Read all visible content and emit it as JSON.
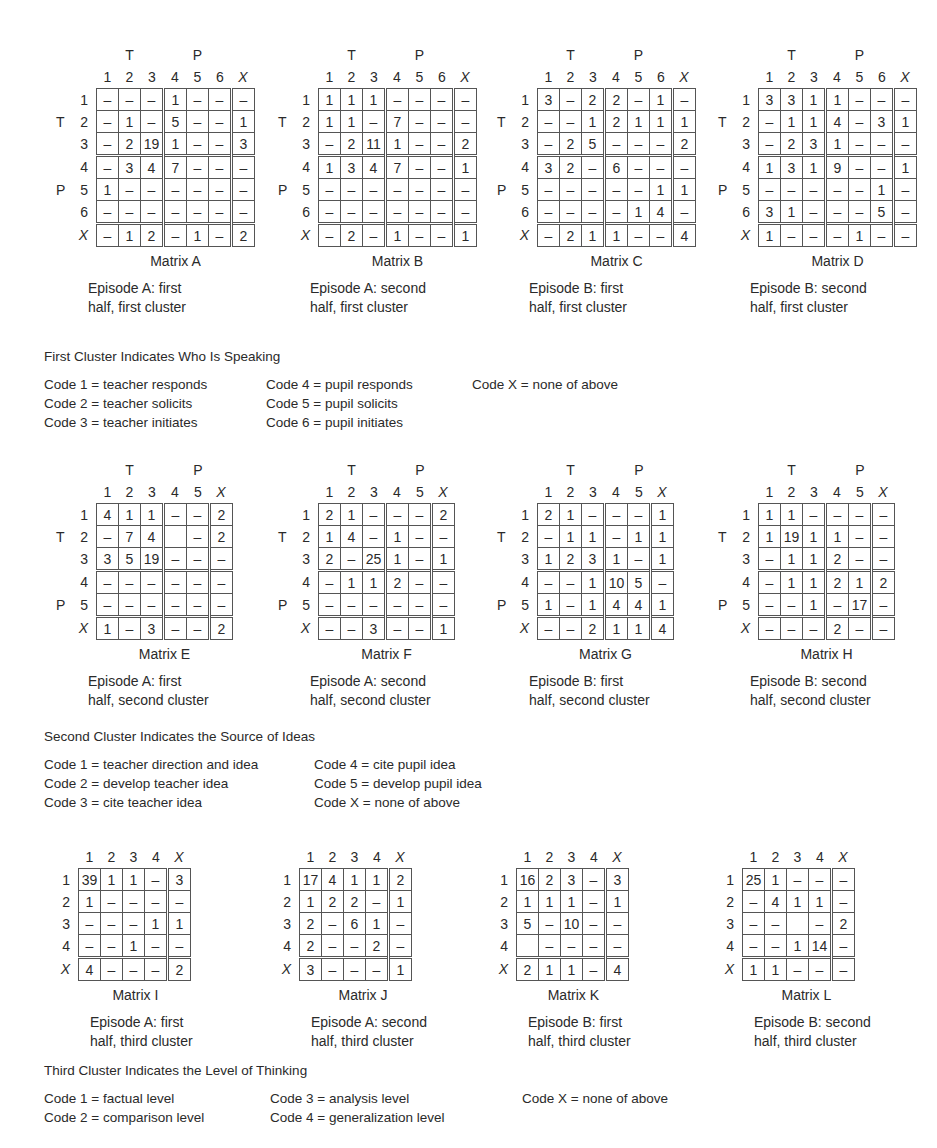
{
  "sets": [
    {
      "id": "first",
      "group_labels": {
        "teacher": "T",
        "pupil": "P"
      },
      "legend": {
        "heading": "First Cluster Indicates Who Is Speaking",
        "columns": [
          [
            "Code 1 = teacher responds",
            "Code 2 = teacher solicits",
            "Code 3 = teacher initiates"
          ],
          [
            "Code 4 = pupil responds",
            "Code 5 = pupil solicits",
            "Code 6 = pupil initiates"
          ],
          [
            "Code X = none of above"
          ]
        ]
      },
      "matrices": [
        {
          "name": "Matrix A",
          "letter": "A",
          "caption_line1": "Episode A: first",
          "caption_line2": "half, first cluster",
          "col_headers": [
            "1",
            "2",
            "3",
            "4",
            "5",
            "6",
            "X"
          ],
          "row_headers": [
            "1",
            "2",
            "3",
            "4",
            "5",
            "6",
            "X"
          ],
          "rows": [
            [
              "–",
              "–",
              "–",
              "1",
              "–",
              "–",
              "–"
            ],
            [
              "–",
              "1",
              "–",
              "5",
              "–",
              "–",
              "1"
            ],
            [
              "–",
              "2",
              "19",
              "1",
              "–",
              "–",
              "3"
            ],
            [
              "–",
              "3",
              "4",
              "7",
              "–",
              "–",
              "–"
            ],
            [
              "1",
              "–",
              "–",
              "–",
              "–",
              "–",
              "–"
            ],
            [
              "–",
              "–",
              "–",
              "–",
              "–",
              "–",
              "–"
            ],
            [
              "–",
              "1",
              "2",
              "–",
              "1",
              "–",
              "2"
            ]
          ]
        },
        {
          "name": "Matrix B",
          "letter": "B",
          "caption_line1": "Episode A: second",
          "caption_line2": "half, first cluster",
          "col_headers": [
            "1",
            "2",
            "3",
            "4",
            "5",
            "6",
            "X"
          ],
          "row_headers": [
            "1",
            "2",
            "3",
            "4",
            "5",
            "6",
            "X"
          ],
          "rows": [
            [
              "1",
              "1",
              "1",
              "–",
              "–",
              "–",
              "–"
            ],
            [
              "1",
              "1",
              "–",
              "7",
              "–",
              "–",
              "–"
            ],
            [
              "–",
              "2",
              "11",
              "1",
              "–",
              "–",
              "2"
            ],
            [
              "1",
              "3",
              "4",
              "7",
              "–",
              "–",
              "1"
            ],
            [
              "–",
              "–",
              "–",
              "–",
              "–",
              "–",
              "–"
            ],
            [
              "–",
              "–",
              "–",
              "–",
              "–",
              "–",
              "–"
            ],
            [
              "–",
              "2",
              "–",
              "1",
              "–",
              "–",
              "1"
            ]
          ]
        },
        {
          "name": "Matrix C",
          "letter": "C",
          "caption_line1": "Episode B: first",
          "caption_line2": "half, first cluster",
          "col_headers": [
            "1",
            "2",
            "3",
            "4",
            "5",
            "6",
            "X"
          ],
          "row_headers": [
            "1",
            "2",
            "3",
            "4",
            "5",
            "6",
            "X"
          ],
          "rows": [
            [
              "3",
              "–",
              "2",
              "2",
              "–",
              "1",
              "–"
            ],
            [
              "–",
              "–",
              "1",
              "2",
              "1",
              "1",
              "1"
            ],
            [
              "–",
              "2",
              "5",
              "–",
              "–",
              "–",
              "2"
            ],
            [
              "3",
              "2",
              "–",
              "6",
              "–",
              "–",
              "–"
            ],
            [
              "–",
              "–",
              "–",
              "–",
              "–",
              "1",
              "1"
            ],
            [
              "–",
              "–",
              "–",
              "–",
              "1",
              "4",
              "–"
            ],
            [
              "–",
              "2",
              "1",
              "1",
              "–",
              "–",
              "4"
            ]
          ]
        },
        {
          "name": "Matrix D",
          "letter": "D",
          "caption_line1": "Episode B: second",
          "caption_line2": "half, first cluster",
          "col_headers": [
            "1",
            "2",
            "3",
            "4",
            "5",
            "6",
            "X"
          ],
          "row_headers": [
            "1",
            "2",
            "3",
            "4",
            "5",
            "6",
            "X"
          ],
          "rows": [
            [
              "3",
              "3",
              "1",
              "1",
              "–",
              "–",
              "–"
            ],
            [
              "–",
              "1",
              "1",
              "4",
              "–",
              "3",
              "1"
            ],
            [
              "–",
              "2",
              "3",
              "1",
              "–",
              "–",
              "–"
            ],
            [
              "1",
              "3",
              "1",
              "9",
              "–",
              "–",
              "1"
            ],
            [
              "–",
              "–",
              "–",
              "–",
              "–",
              "1",
              "–"
            ],
            [
              "3",
              "1",
              "–",
              "–",
              "–",
              "5",
              "–"
            ],
            [
              "1",
              "–",
              "–",
              "–",
              "1",
              "–",
              "–"
            ]
          ]
        }
      ]
    },
    {
      "id": "second",
      "group_labels": {
        "teacher": "T",
        "pupil": "P"
      },
      "legend": {
        "heading": "Second Cluster Indicates the Source of Ideas",
        "columns": [
          [
            "Code 1 = teacher direction and idea",
            "Code 2 = develop teacher idea",
            "Code 3 = cite teacher idea"
          ],
          [
            "Code 4 = cite pupil idea",
            "Code 5 = develop pupil idea",
            "Code X = none of above"
          ]
        ]
      },
      "matrices": [
        {
          "name": "Matrix E",
          "letter": "E",
          "caption_line1": "Episode A: first",
          "caption_line2": "half, second cluster",
          "col_headers": [
            "1",
            "2",
            "3",
            "4",
            "5",
            "X"
          ],
          "row_headers": [
            "1",
            "2",
            "3",
            "4",
            "5",
            "X"
          ],
          "rows": [
            [
              "4",
              "1",
              "1",
              "–",
              "–",
              "2"
            ],
            [
              "–",
              "7",
              "4",
              "",
              "–",
              "2"
            ],
            [
              "3",
              "5",
              "19",
              "–",
              "–",
              "–"
            ],
            [
              "–",
              "–",
              "–",
              "–",
              "–",
              "–"
            ],
            [
              "–",
              "–",
              "–",
              "–",
              "–",
              "–"
            ],
            [
              "1",
              "–",
              "3",
              "–",
              "–",
              "2"
            ]
          ]
        },
        {
          "name": "Matrix F",
          "letter": "F",
          "caption_line1": "Episode A: second",
          "caption_line2": "half, second cluster",
          "col_headers": [
            "1",
            "2",
            "3",
            "4",
            "5",
            "X"
          ],
          "row_headers": [
            "1",
            "2",
            "3",
            "4",
            "5",
            "X"
          ],
          "rows": [
            [
              "2",
              "1",
              "–",
              "–",
              "–",
              "2"
            ],
            [
              "1",
              "4",
              "–",
              "1",
              "–",
              "–"
            ],
            [
              "2",
              "–",
              "25",
              "1",
              "–",
              "1"
            ],
            [
              "–",
              "1",
              "1",
              "2",
              "–",
              "–"
            ],
            [
              "–",
              "–",
              "–",
              "–",
              "–",
              "–"
            ],
            [
              "–",
              "–",
              "3",
              "–",
              "–",
              "1"
            ]
          ]
        },
        {
          "name": "Matrix G",
          "letter": "G",
          "caption_line1": "Episode B: first",
          "caption_line2": "half, second cluster",
          "col_headers": [
            "1",
            "2",
            "3",
            "4",
            "5",
            "X"
          ],
          "row_headers": [
            "1",
            "2",
            "3",
            "4",
            "5",
            "X"
          ],
          "rows": [
            [
              "2",
              "1",
              "–",
              "–",
              "–",
              "1"
            ],
            [
              "–",
              "1",
              "1",
              "–",
              "1",
              "1"
            ],
            [
              "1",
              "2",
              "3",
              "1",
              "–",
              "1"
            ],
            [
              "–",
              "–",
              "1",
              "10",
              "5",
              "–"
            ],
            [
              "1",
              "–",
              "1",
              "4",
              "4",
              "1"
            ],
            [
              "–",
              "–",
              "2",
              "1",
              "1",
              "4"
            ]
          ]
        },
        {
          "name": "Matrix H",
          "letter": "H",
          "caption_line1": "Episode B: second",
          "caption_line2": "half, second cluster",
          "col_headers": [
            "1",
            "2",
            "3",
            "4",
            "5",
            "X"
          ],
          "row_headers": [
            "1",
            "2",
            "3",
            "4",
            "5",
            "X"
          ],
          "rows": [
            [
              "1",
              "1",
              "–",
              "–",
              "–",
              "–"
            ],
            [
              "1",
              "19",
              "1",
              "1",
              "–",
              "–"
            ],
            [
              "–",
              "1",
              "1",
              "2",
              "–",
              "–"
            ],
            [
              "–",
              "1",
              "1",
              "2",
              "1",
              "2"
            ],
            [
              "–",
              "–",
              "1",
              "–",
              "17",
              "–"
            ],
            [
              "–",
              "–",
              "–",
              "2",
              "–",
              "–"
            ]
          ]
        }
      ]
    },
    {
      "id": "third",
      "legend": {
        "heading": "Third Cluster Indicates the Level of Thinking",
        "columns": [
          [
            "Code 1 = factual level",
            "Code 2 = comparison level"
          ],
          [
            "Code 3 = analysis level",
            "Code 4 = generalization level"
          ],
          [
            "Code X = none of above"
          ]
        ]
      },
      "matrices": [
        {
          "name": "Matrix I",
          "letter": "I",
          "caption_line1": "Episode A: first",
          "caption_line2": "half, third cluster",
          "col_headers": [
            "1",
            "2",
            "3",
            "4",
            "X"
          ],
          "row_headers": [
            "1",
            "2",
            "3",
            "4",
            "X"
          ],
          "rows": [
            [
              "39",
              "1",
              "1",
              "–",
              "3"
            ],
            [
              "1",
              "–",
              "–",
              "–",
              "–"
            ],
            [
              "–",
              "–",
              "–",
              "1",
              "1"
            ],
            [
              "–",
              "–",
              "1",
              "–",
              "–"
            ],
            [
              "4",
              "–",
              "–",
              "–",
              "2"
            ]
          ]
        },
        {
          "name": "Matrix J",
          "letter": "J",
          "caption_line1": "Episode A: second",
          "caption_line2": "half, third cluster",
          "col_headers": [
            "1",
            "2",
            "3",
            "4",
            "X"
          ],
          "row_headers": [
            "1",
            "2",
            "3",
            "4",
            "X"
          ],
          "rows": [
            [
              "17",
              "4",
              "1",
              "1",
              "2"
            ],
            [
              "1",
              "2",
              "2",
              "–",
              "1"
            ],
            [
              "2",
              "–",
              "6",
              "1",
              "–"
            ],
            [
              "2",
              "–",
              "–",
              "2",
              "–"
            ],
            [
              "3",
              "–",
              "–",
              "–",
              "1"
            ]
          ]
        },
        {
          "name": "Matrix K",
          "letter": "K",
          "caption_line1": "Episode B: first",
          "caption_line2": "half, third cluster",
          "col_headers": [
            "1",
            "2",
            "3",
            "4",
            "X"
          ],
          "row_headers": [
            "1",
            "2",
            "3",
            "4",
            "X"
          ],
          "rows": [
            [
              "16",
              "2",
              "3",
              "–",
              "3"
            ],
            [
              "1",
              "1",
              "1",
              "–",
              "1"
            ],
            [
              "5",
              "–",
              "10",
              "–",
              "–"
            ],
            [
              "",
              "–",
              "–",
              "–",
              "–"
            ],
            [
              "2",
              "1",
              "1",
              "–",
              "4"
            ]
          ]
        },
        {
          "name": "Matrix L",
          "letter": "L",
          "caption_line1": "Episode B: second",
          "caption_line2": "half, third cluster",
          "col_headers": [
            "1",
            "2",
            "3",
            "4",
            "X"
          ],
          "row_headers": [
            "1",
            "2",
            "3",
            "4",
            "X"
          ],
          "rows": [
            [
              "25",
              "1",
              "–",
              "–",
              "–"
            ],
            [
              "–",
              "4",
              "1",
              "1",
              "–"
            ],
            [
              "–",
              "–",
              "",
              "–",
              "2"
            ],
            [
              "–",
              "–",
              "1",
              "14",
              "–"
            ],
            [
              "1",
              "1",
              "–",
              "–",
              "–"
            ]
          ]
        }
      ]
    }
  ]
}
